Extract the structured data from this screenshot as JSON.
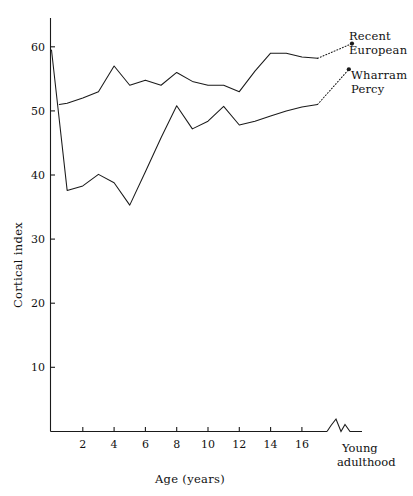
{
  "chart_data": {
    "type": "line",
    "title": "",
    "xlabel": "Age (years)",
    "ylabel": "Cortical index",
    "xlim": [
      0,
      17
    ],
    "ylim": [
      0,
      65
    ],
    "grid": false,
    "legend_position": "right-inline",
    "x_tick_labels": [
      "2",
      "4",
      "6",
      "8",
      "10",
      "12",
      "14",
      "16"
    ],
    "x_tick_values": [
      2,
      4,
      6,
      8,
      10,
      12,
      14,
      16
    ],
    "y_tick_labels": [
      "10",
      "20",
      "30",
      "40",
      "50",
      "60"
    ],
    "y_tick_values": [
      10,
      20,
      30,
      40,
      50,
      60
    ],
    "axis_break_label": "Young\nadulthood",
    "axis_break_label_line1": "Young",
    "axis_break_label_line2": "adulthood",
    "series": [
      {
        "name": "Recent European",
        "label_line1": "Recent",
        "label_line2": "European",
        "style": "solid",
        "x": [
          0.5,
          1,
          2,
          3,
          4,
          5,
          6,
          7,
          8,
          9,
          10,
          11,
          12,
          13,
          14,
          15,
          16,
          17
        ],
        "values": [
          51.0,
          51.2,
          52.0,
          53.0,
          57.0,
          54.0,
          54.8,
          54.0,
          56.0,
          54.6,
          54.0,
          54.0,
          53.0,
          56.2,
          59.0,
          59.0,
          58.4,
          58.2
        ],
        "adult_x": 19.2,
        "adult_value": 60.5,
        "dotted_tail": true
      },
      {
        "name": "Wharram Percy",
        "label_line1": "Wharram",
        "label_line2": "Percy",
        "style": "solid",
        "x": [
          0,
          1,
          2,
          3,
          4,
          5,
          6,
          7,
          8,
          9,
          10,
          11,
          12,
          13,
          14,
          15,
          16,
          17
        ],
        "values": [
          59.5,
          37.6,
          38.3,
          40.1,
          38.8,
          35.3,
          40.5,
          45.8,
          50.8,
          47.2,
          48.4,
          50.7,
          47.8,
          48.4,
          49.2,
          50.0,
          50.6,
          51.0
        ],
        "adult_x": 19.0,
        "adult_value": 56.5,
        "dotted_tail": true
      }
    ]
  },
  "axis": {
    "y_title": "Cortical index",
    "x_title": "Age (years)"
  },
  "icons": {
    "axis_break": "axis-break-zigzag"
  }
}
